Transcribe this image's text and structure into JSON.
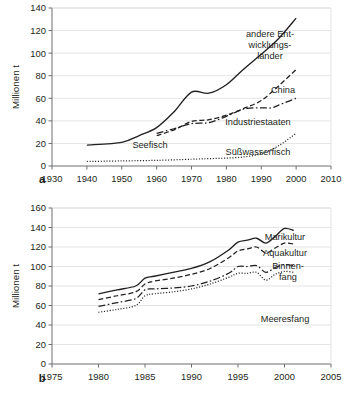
{
  "chart_data": [
    {
      "id": "a",
      "type": "line",
      "panel_letter": "a",
      "title": "",
      "xlabel": "",
      "ylabel": "Millionen t",
      "xlim": [
        1930,
        2010
      ],
      "ylim": [
        0,
        140
      ],
      "xticks": [
        1930,
        1940,
        1950,
        1960,
        1970,
        1980,
        1990,
        2000,
        2010
      ],
      "yticks": [
        0,
        20,
        40,
        60,
        80,
        100,
        120,
        140
      ],
      "grid": true,
      "legend_position": "inline-right",
      "series": [
        {
          "name": "andere Entwicklungsländer",
          "label": "andere Ent-\nwicklungs-\nländer",
          "label_lines": [
            "andere Ent-",
            "wicklungs-",
            "länder"
          ],
          "style": "solid",
          "x": [
            1940,
            1950,
            1955,
            1960,
            1965,
            1970,
            1975,
            1980,
            1985,
            1990,
            1995,
            2000
          ],
          "y": [
            18.5,
            21,
            27,
            34,
            48,
            65.5,
            64.5,
            72,
            86,
            99,
            113,
            131
          ]
        },
        {
          "name": "China",
          "label": "China",
          "style": "dashed",
          "x": [
            1960,
            1965,
            1970,
            1975,
            1980,
            1985,
            1990,
            1995,
            2000
          ],
          "y": [
            27,
            32,
            39.5,
            41,
            45,
            51,
            58,
            71,
            85.5
          ]
        },
        {
          "name": "Industriestaaten",
          "label": "Industriestaaten",
          "style": "dashdot",
          "x": [
            1960,
            1965,
            1970,
            1975,
            1980,
            1985,
            1990,
            1993,
            1995,
            2000
          ],
          "y": [
            29,
            33,
            37.5,
            38.5,
            44,
            50.5,
            51.5,
            51.5,
            54,
            60
          ]
        },
        {
          "name": "Süßwasserfisch",
          "label": "Süßwasserfisch",
          "style": "dotted",
          "x": [
            1940,
            1950,
            1960,
            1970,
            1975,
            1980,
            1985,
            1990,
            1995,
            2000
          ],
          "y": [
            4,
            4.5,
            5,
            6,
            6.5,
            7,
            8,
            11,
            18,
            29
          ]
        }
      ],
      "annotations": [
        {
          "text": "Seefisch",
          "x": 1958,
          "y": 11
        }
      ]
    },
    {
      "id": "b",
      "type": "line",
      "panel_letter": "b",
      "title": "",
      "xlabel": "",
      "ylabel": "Millionen t",
      "xlim": [
        1975,
        2005
      ],
      "ylim": [
        0,
        160
      ],
      "xticks": [
        1975,
        1980,
        1985,
        1990,
        1995,
        2000,
        2005
      ],
      "yticks": [
        0,
        20,
        40,
        60,
        80,
        100,
        120,
        140,
        160
      ],
      "grid": true,
      "legend_position": "inline-right",
      "series": [
        {
          "name": "Marikultur",
          "label": "Marikultur",
          "style": "solid",
          "x": [
            1980,
            1982,
            1984,
            1985,
            1986,
            1988,
            1990,
            1992,
            1994,
            1995,
            1996,
            1997,
            1998,
            1999,
            2000,
            2001
          ],
          "y": [
            72,
            76,
            80,
            88,
            90,
            94,
            98,
            105,
            117,
            125,
            127,
            129,
            124,
            131,
            139,
            137
          ]
        },
        {
          "name": "Aquakultur",
          "label": "Aquakultur",
          "style": "dashed",
          "x": [
            1980,
            1982,
            1984,
            1985,
            1986,
            1988,
            1990,
            1992,
            1994,
            1995,
            1996,
            1997,
            1998,
            1999,
            2000,
            2001
          ],
          "y": [
            66,
            70,
            74,
            82,
            85,
            88,
            92,
            98,
            109,
            116,
            118,
            120,
            114,
            119,
            124,
            123
          ]
        },
        {
          "name": "Binnenfang",
          "label": "Binnen-\nfang",
          "label_lines": [
            "Binnen-",
            "fang"
          ],
          "style": "dashdot",
          "x": [
            1980,
            1982,
            1984,
            1985,
            1986,
            1988,
            1990,
            1992,
            1994,
            1995,
            1996,
            1997,
            1998,
            1999,
            2000,
            2001
          ],
          "y": [
            59,
            63,
            67,
            76,
            77,
            78,
            80,
            85,
            93,
            100,
            100,
            101,
            94,
            99,
            102,
            101
          ]
        },
        {
          "name": "Meeresfang",
          "label": "Meeresfang",
          "style": "dotted",
          "x": [
            1980,
            1982,
            1984,
            1985,
            1986,
            1988,
            1990,
            1992,
            1994,
            1995,
            1996,
            1997,
            1998,
            1999,
            2000,
            2001
          ],
          "y": [
            53,
            56,
            60,
            70,
            72,
            74,
            77,
            82,
            89,
            93,
            93,
            94,
            86,
            92,
            95,
            94
          ]
        }
      ],
      "annotations": []
    }
  ],
  "colors": {
    "line": "#231f20",
    "grid": "#d9d9d9",
    "axis": "#6d6e71",
    "background": "#ffffff"
  }
}
